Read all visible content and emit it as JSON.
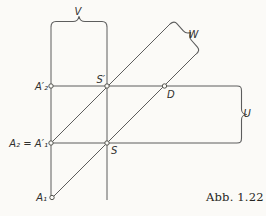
{
  "figure": {
    "caption": "Abb. 1.22",
    "labels": {
      "a1": "A₁",
      "a2_eq_a1p": "A₂ = A′₁",
      "a2p": "A′₂",
      "s": "S",
      "s_prime": "S′",
      "d": "D",
      "v": "V",
      "w": "W",
      "u": "U"
    },
    "colors": {
      "background": "#fbfaf7",
      "line": "#5d5d5d",
      "text": "#30302e"
    }
  }
}
